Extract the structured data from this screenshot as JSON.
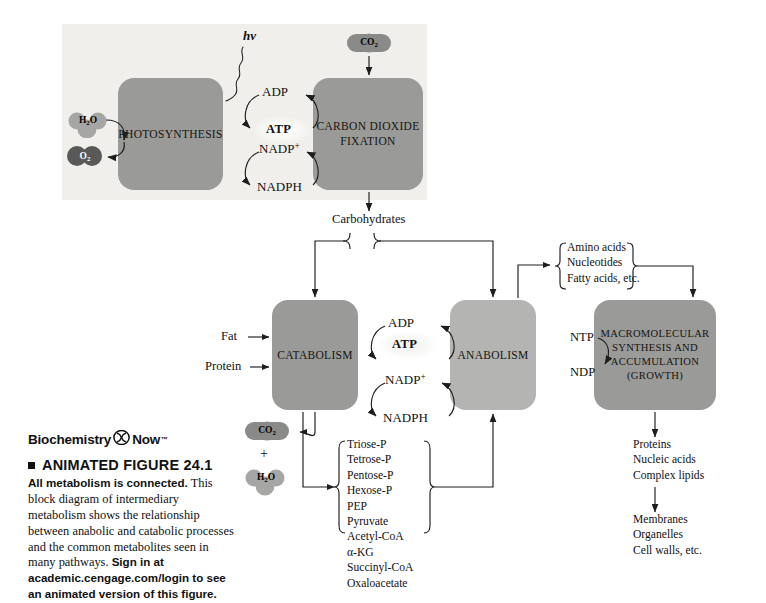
{
  "figure": {
    "panel_bg": "#f0efec",
    "page_bg": "#ffffff",
    "box_fill_dark": "#9a9a99",
    "box_fill_light": "#b4b4b2",
    "molecule_light": "#a6a6a4",
    "molecule_dark": "#59595a",
    "line_color": "#1d1d1d"
  },
  "photosynthesis_panel": {
    "light_symbol": "hv",
    "photosynthesis_box": "PHOTOSYNTHESIS",
    "co2_fixation_box_line1": "CARBON DIOXIDE",
    "co2_fixation_box_line2": "FIXATION",
    "input_water": "H2O",
    "output_oxygen": "O2",
    "input_co2": "CO2",
    "cofactors": {
      "adp": "ADP",
      "atp": "ATP",
      "nadp_plus": "NADP+",
      "nadph": "NADPH"
    },
    "output_label": "Carbohydrates"
  },
  "metabolism_panel": {
    "catabolism_box": "CATABOLISM",
    "anabolism_box": "ANABOLISM",
    "macromolecular_box_lines": [
      "MACROMOLECULAR",
      "SYNTHESIS AND",
      "ACCUMULATION",
      "(GROWTH)"
    ],
    "catabolism_inputs": [
      "Fat",
      "Protein"
    ],
    "catabolism_waste": {
      "co2": "CO2",
      "plus": "+",
      "h2o": "H2O"
    },
    "cofactors": {
      "adp": "ADP",
      "atp": "ATP",
      "nadp_plus": "NADP+",
      "nadph": "NADPH"
    },
    "nucleotide_cycle": {
      "ntp": "NTP",
      "ndp": "NDP"
    },
    "building_blocks": [
      "Amino acids",
      "Nucleotides",
      "Fatty acids, etc."
    ],
    "common_metabolites": [
      "Triose-P",
      "Tetrose-P",
      "Pentose-P",
      "Hexose-P",
      "PEP",
      "Pyruvate",
      "Acetyl-CoA",
      "α-KG",
      "Succinyl-CoA",
      "Oxaloacetate"
    ],
    "products_primary": [
      "Proteins",
      "Nucleic acids",
      "Complex lipids"
    ],
    "products_secondary": [
      "Membranes",
      "Organelles",
      "Cell walls, etc."
    ]
  },
  "caption": {
    "brand_name": "Biochemistry",
    "brand_suffix": "Now",
    "brand_tm": "™",
    "figure_title": "ANIMATED FIGURE 24.1",
    "lead_sentence": "All metabolism is connected.",
    "body_text": " This block diagram of intermediary metabolism shows the relationship between anabolic and catabolic processes and the common metabolites seen in many pathways. ",
    "call_to_action": "Sign in at academic.cengage.com/login to see an animated version of this figure."
  }
}
